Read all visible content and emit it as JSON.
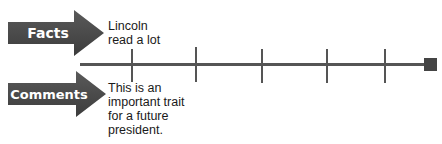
{
  "facts": {
    "label": "Facts",
    "note_lines": [
      "Lincoln",
      "read a lot"
    ]
  },
  "comments": {
    "label": "Comments",
    "note_lines": [
      "This is an",
      "important trait",
      "for a future",
      "president."
    ]
  },
  "timeline": {
    "tick_count": 5,
    "end_marker": "square",
    "color": "#555555"
  },
  "colors": {
    "arrow_fill": "#4a4a4a",
    "arrow_text": "#ffffff"
  }
}
